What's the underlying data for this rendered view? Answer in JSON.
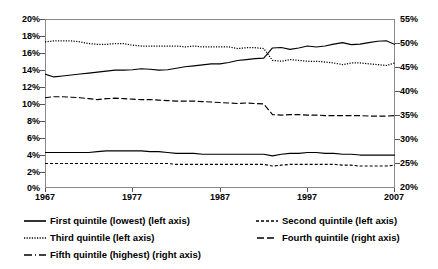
{
  "chart_data": {
    "type": "line",
    "title": "",
    "subtitle": "",
    "xlabel": "",
    "ylabel": "",
    "y2label": "",
    "grid": false,
    "legend_position": "bottom",
    "x": [
      1967,
      1968,
      1969,
      1970,
      1971,
      1972,
      1973,
      1974,
      1975,
      1976,
      1977,
      1978,
      1979,
      1980,
      1981,
      1982,
      1983,
      1984,
      1985,
      1986,
      1987,
      1988,
      1989,
      1990,
      1991,
      1992,
      1993,
      1994,
      1995,
      1996,
      1997,
      1998,
      1999,
      2000,
      2001,
      2002,
      2003,
      2004,
      2005,
      2006,
      2007
    ],
    "x_ticks": [
      "1967",
      "1977",
      "1987",
      "1997",
      "2007"
    ],
    "xlim": [
      1967,
      2007
    ],
    "ylim": [
      0,
      20
    ],
    "y_ticks": [
      "0%",
      "2%",
      "4%",
      "6%",
      "8%",
      "10%",
      "12%",
      "14%",
      "16%",
      "18%",
      "20%"
    ],
    "y2lim": [
      20,
      55
    ],
    "y2_ticks": [
      "20%",
      "25%",
      "30%",
      "35%",
      "40%",
      "45%",
      "50%",
      "55%"
    ],
    "series": [
      {
        "name": "First quintile (lowest) (left axis)",
        "axis": "left",
        "style": "solid",
        "values": [
          4.2,
          4.2,
          4.2,
          4.2,
          4.2,
          4.2,
          4.3,
          4.4,
          4.4,
          4.4,
          4.4,
          4.4,
          4.3,
          4.3,
          4.2,
          4.1,
          4.1,
          4.1,
          4.0,
          4.0,
          4.0,
          4.0,
          4.0,
          4.0,
          4.0,
          4.0,
          3.8,
          4.0,
          4.1,
          4.1,
          4.2,
          4.2,
          4.1,
          4.1,
          4.0,
          4.0,
          3.9,
          3.9,
          3.9,
          3.9,
          3.9
        ]
      },
      {
        "name": "Second quintile (left axis)",
        "axis": "left",
        "style": "dashed",
        "values": [
          2.9,
          2.9,
          2.9,
          2.9,
          2.9,
          2.9,
          2.9,
          2.9,
          2.9,
          2.9,
          2.9,
          2.9,
          2.9,
          2.9,
          2.9,
          2.8,
          2.8,
          2.8,
          2.8,
          2.8,
          2.8,
          2.8,
          2.8,
          2.8,
          2.8,
          2.8,
          2.6,
          2.7,
          2.8,
          2.8,
          2.8,
          2.8,
          2.8,
          2.8,
          2.7,
          2.7,
          2.6,
          2.6,
          2.6,
          2.6,
          2.7
        ]
      },
      {
        "name": "Third quintile (left axis)",
        "axis": "left",
        "style": "dotted",
        "values": [
          17.3,
          17.4,
          17.4,
          17.4,
          17.3,
          17.1,
          17.0,
          17.0,
          17.1,
          17.1,
          16.9,
          16.8,
          16.8,
          16.8,
          16.8,
          16.8,
          16.7,
          16.8,
          16.7,
          16.7,
          16.7,
          16.7,
          16.5,
          16.6,
          16.6,
          16.5,
          15.1,
          15.0,
          15.2,
          15.1,
          15.0,
          15.0,
          14.9,
          14.8,
          14.6,
          14.8,
          14.8,
          14.7,
          14.6,
          14.5,
          14.8
        ]
      },
      {
        "name": "Fourth quintile (right axis)",
        "axis": "right",
        "style": "longdash",
        "values": [
          38.7,
          38.9,
          38.9,
          38.8,
          38.7,
          38.5,
          38.3,
          38.5,
          38.6,
          38.5,
          38.4,
          38.3,
          38.3,
          38.2,
          38.1,
          38.0,
          38.0,
          38.0,
          37.9,
          37.8,
          37.7,
          37.6,
          37.5,
          37.6,
          37.5,
          37.4,
          35.2,
          35.1,
          35.2,
          35.2,
          35.1,
          35.1,
          35.0,
          35.0,
          35.0,
          35.0,
          35.0,
          34.9,
          34.9,
          34.9,
          35.0
        ]
      },
      {
        "name": "Fifth quintile (highest) (right axis)",
        "axis": "right",
        "style": "solid",
        "values": [
          43.6,
          43.0,
          43.2,
          43.4,
          43.6,
          43.8,
          44.0,
          44.2,
          44.4,
          44.4,
          44.5,
          44.7,
          44.6,
          44.4,
          44.5,
          44.8,
          45.1,
          45.3,
          45.5,
          45.7,
          45.7,
          46.0,
          46.4,
          46.6,
          46.8,
          46.9,
          49.0,
          49.1,
          48.7,
          49.0,
          49.4,
          49.2,
          49.4,
          49.8,
          50.1,
          49.7,
          49.8,
          50.1,
          50.4,
          50.5,
          49.7
        ]
      }
    ]
  },
  "axes": {
    "left_ticks": [
      "20%",
      "18%",
      "16%",
      "14%",
      "12%",
      "10%",
      "8%",
      "6%",
      "4%",
      "2%",
      "0%"
    ],
    "right_ticks": [
      "55%",
      "50%",
      "45%",
      "40%",
      "35%",
      "30%",
      "25%",
      "20%"
    ],
    "x_ticks": [
      "1967",
      "1977",
      "1987",
      "1997",
      "2007"
    ]
  },
  "legend": {
    "items": [
      {
        "label": "First quintile (lowest) (left axis)",
        "style": "solid"
      },
      {
        "label": "Second quintile (left axis)",
        "style": "dashed"
      },
      {
        "label": "Third quintile (left axis)",
        "style": "dotted"
      },
      {
        "label": "Fourth quintile (right axis)",
        "style": "longdash"
      },
      {
        "label": "Fifth quintile (highest) (right axis)",
        "style": "longdash2"
      }
    ]
  }
}
